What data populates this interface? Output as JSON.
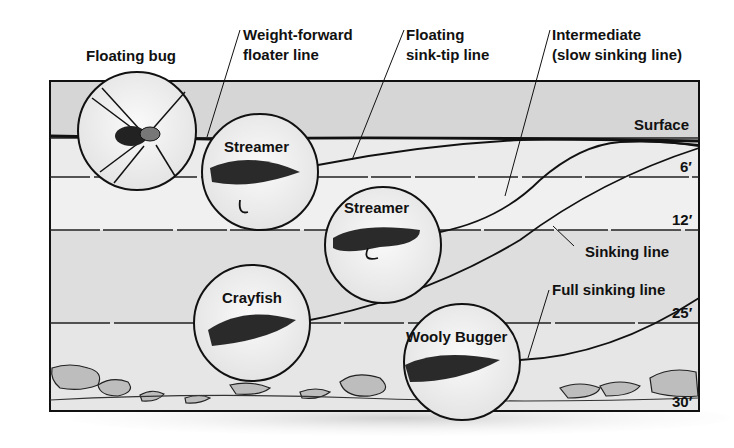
{
  "diagram": {
    "callouts": {
      "floating_bug": "Floating bug",
      "weight_forward_line": [
        "Weight-forward",
        "floater line"
      ],
      "floating_sink_tip": [
        "Floating",
        "sink-tip line"
      ],
      "intermediate": [
        "Intermediate",
        "(slow sinking line)"
      ],
      "sinking_line": "Sinking line",
      "full_sinking_line": "Full sinking line"
    },
    "flies": [
      {
        "name": "Floating bug",
        "label": ""
      },
      {
        "name": "Streamer",
        "label": "Streamer"
      },
      {
        "name": "Streamer",
        "label": "Streamer"
      },
      {
        "name": "Crayfish",
        "label": "Crayfish"
      },
      {
        "name": "Wooly Bugger",
        "label": "Wooly Bugger"
      }
    ],
    "depths": {
      "surface": "Surface",
      "d6": "6′",
      "d12": "12′",
      "d25": "25′",
      "d30": "30′"
    },
    "colors": {
      "ink": "#111111",
      "water": "#dcdcdc",
      "water_light": "#ececec",
      "background": "#ffffff"
    }
  }
}
